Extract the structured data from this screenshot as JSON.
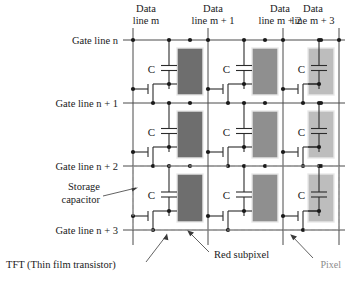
{
  "diagram": {
    "headers": [
      {
        "id": "data-line-m",
        "l1": "Data",
        "l2": "line m"
      },
      {
        "id": "data-line-m1",
        "l1": "Data",
        "l2": "line m + 1"
      },
      {
        "id": "data-line-m2",
        "l1": "Data",
        "l2": "line m + 2"
      },
      {
        "id": "data-line-m3",
        "l1": "Data",
        "l2": "line m + 3"
      }
    ],
    "gate_lines": [
      {
        "id": "gate-line-n",
        "label": "Gate line n"
      },
      {
        "id": "gate-line-n1",
        "label": "Gate line n + 1"
      },
      {
        "id": "gate-line-n2",
        "label": "Gate line n + 2"
      },
      {
        "id": "gate-line-n3",
        "label": "Gate line n + 3"
      }
    ],
    "capacitor_label": "C",
    "annotations": [
      {
        "id": "storage-capacitor",
        "l1": "Storage",
        "l2": "capacitor"
      },
      {
        "id": "tft",
        "l1": "TFT (Thin film transistor)",
        "l2": ""
      },
      {
        "id": "red-subpixel",
        "l1": "Red subpixel",
        "l2": ""
      },
      {
        "id": "pixel",
        "l1": "Pixel",
        "l2": ""
      }
    ],
    "subpixel_colors": [
      "#6e6e6e",
      "#8f8f8f",
      "#bdbdbd"
    ],
    "subpixel_names": [
      "red-subpixel",
      "green-subpixel",
      "blue-subpixel"
    ],
    "colors": {
      "wire": "#4a4a4a",
      "node": "#1a1a1a",
      "pixel_boundary": "#9a9a9a",
      "text": "#1a1a1a",
      "pixel_label": "#8c8c8c",
      "background": "#ffffff"
    },
    "geometry": {
      "data_x": [
        133,
        208,
        283,
        339
      ],
      "gate_y": [
        40,
        103,
        166,
        230
      ],
      "col_pitch": 75,
      "row_pitch": 63
    }
  }
}
